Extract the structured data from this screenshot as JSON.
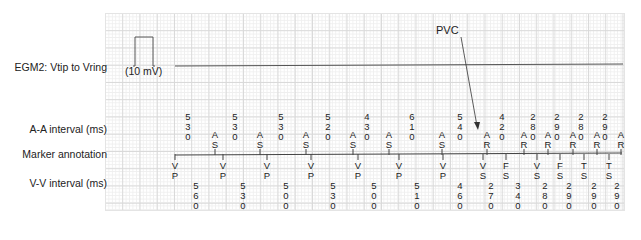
{
  "diagram": {
    "egm_label": "EGM2: Vtip to Vring",
    "calibration": {
      "label": "(10 mV)"
    },
    "annotation": {
      "label": "PVC"
    },
    "rows": {
      "aa_label": "A-A interval (ms)",
      "marker_label": "Marker annotation",
      "vv_label": "V-V interval (ms)"
    },
    "aa_intervals": [
      {
        "x": 188,
        "value": "530"
      },
      {
        "x": 235,
        "value": "530"
      },
      {
        "x": 281,
        "value": "530"
      },
      {
        "x": 328,
        "value": "520"
      },
      {
        "x": 367,
        "value": "430"
      },
      {
        "x": 412,
        "value": "610"
      },
      {
        "x": 460,
        "value": "540"
      },
      {
        "x": 502,
        "value": "420"
      },
      {
        "x": 533,
        "value": "280"
      },
      {
        "x": 557,
        "value": "290"
      },
      {
        "x": 581,
        "value": "280"
      },
      {
        "x": 605,
        "value": "290"
      }
    ],
    "atrial_markers": [
      {
        "x": 215,
        "label": "AS"
      },
      {
        "x": 260,
        "label": "AS"
      },
      {
        "x": 306,
        "label": "AS"
      },
      {
        "x": 353,
        "label": "AS"
      },
      {
        "x": 389,
        "label": "AS"
      },
      {
        "x": 442,
        "label": "AS"
      },
      {
        "x": 487,
        "label": "AR"
      },
      {
        "x": 524,
        "label": "AR"
      },
      {
        "x": 548,
        "label": "AR"
      },
      {
        "x": 573,
        "label": "AR"
      },
      {
        "x": 597,
        "label": "AR"
      },
      {
        "x": 621,
        "label": "AR"
      }
    ],
    "ventricular_markers": [
      {
        "x": 175,
        "label": "VP"
      },
      {
        "x": 223,
        "label": "VP"
      },
      {
        "x": 267,
        "label": "VP"
      },
      {
        "x": 311,
        "label": "VP"
      },
      {
        "x": 358,
        "label": "VP"
      },
      {
        "x": 399,
        "label": "VP"
      },
      {
        "x": 443,
        "label": "VP"
      },
      {
        "x": 483,
        "label": "VS"
      },
      {
        "x": 506,
        "label": "FS"
      },
      {
        "x": 537,
        "label": "VS"
      },
      {
        "x": 560,
        "label": "FS"
      },
      {
        "x": 584,
        "label": "TS"
      },
      {
        "x": 609,
        "label": "TS"
      }
    ],
    "vv_intervals": [
      {
        "x": 196,
        "value": "560"
      },
      {
        "x": 243,
        "value": "530"
      },
      {
        "x": 286,
        "value": "500"
      },
      {
        "x": 333,
        "value": "530"
      },
      {
        "x": 374,
        "value": "500"
      },
      {
        "x": 417,
        "value": "510"
      },
      {
        "x": 460,
        "value": "460"
      },
      {
        "x": 491,
        "value": "270"
      },
      {
        "x": 518,
        "value": "340"
      },
      {
        "x": 545,
        "value": "280"
      },
      {
        "x": 569,
        "value": "290"
      },
      {
        "x": 594,
        "value": "290"
      },
      {
        "x": 617,
        "value": "290"
      }
    ],
    "colors": {
      "grid_major": "#d9d9d9",
      "grid_minor": "#efefef",
      "trace": "#555555",
      "text": "#222222"
    }
  }
}
